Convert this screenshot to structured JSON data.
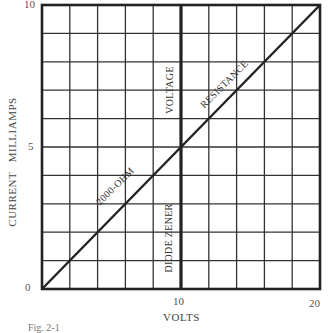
{
  "chart_data": {
    "type": "line",
    "title": "",
    "xlabel": "VOLTS",
    "ylabel": "CURRENT   MILLIAMPS",
    "xlim": [
      0,
      20
    ],
    "ylim": [
      0,
      10
    ],
    "x_ticks": [
      "0",
      "10",
      "20"
    ],
    "y_ticks": [
      "0",
      "5",
      "10"
    ],
    "grid": true,
    "grid_divisions": {
      "x": 10,
      "y": 10
    },
    "series": [
      {
        "name": "2000-OHM RESISTANCE",
        "x": [
          0,
          2,
          4,
          6,
          8,
          10,
          12,
          14,
          16,
          18,
          20
        ],
        "values": [
          0,
          1,
          2,
          3,
          4,
          5,
          6,
          7,
          8,
          9,
          10
        ]
      },
      {
        "name": "VOLTAGE / DIODE ZENER",
        "x": [
          10,
          10
        ],
        "values": [
          0,
          10
        ]
      }
    ],
    "annotations": [
      "2000-OHM",
      "RESISTANCE",
      "VOLTAGE",
      "DIODE ZENER"
    ],
    "legend": null
  },
  "labels": {
    "y_top": "10",
    "y_mid": "5",
    "y_zero": "0",
    "x_mid": "10",
    "x_max": "20",
    "xlabel": "VOLTS",
    "ylabel": "CURRENT   MILLIAMPS",
    "annot_ohm": "2000-OHM",
    "annot_resistance": "RESISTANCE",
    "annot_voltage": "VOLTAGE",
    "annot_zener": "DIODE ZENER",
    "caption": "Fig. 2-1"
  }
}
